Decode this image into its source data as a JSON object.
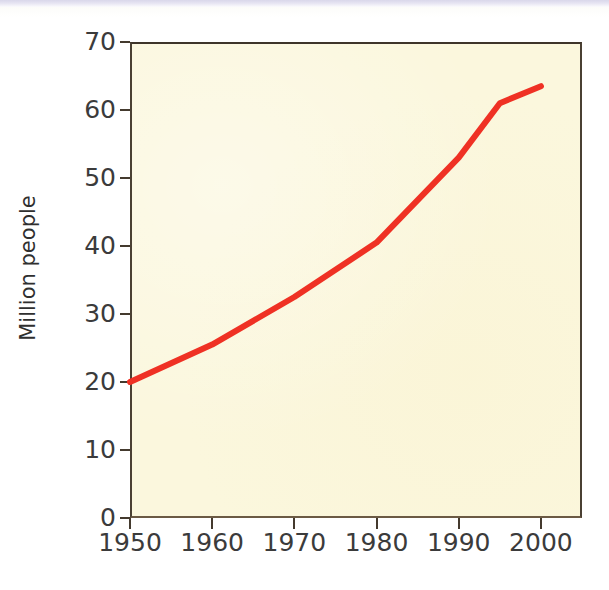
{
  "figure": {
    "background_color": "#ffffff",
    "plot_background_color": "#fbf7dd",
    "frame_color": "#4a4033",
    "series_color": "#ef3124"
  },
  "chart_data": {
    "type": "line",
    "title": "",
    "xlabel": "",
    "ylabel": "Million people",
    "xlim": [
      1950,
      2005
    ],
    "ylim": [
      0,
      70
    ],
    "grid": false,
    "legend": false,
    "x_ticks": [
      1950,
      1960,
      1970,
      1980,
      1990,
      2000
    ],
    "x_tick_labels": [
      "1950",
      "1960",
      "1970",
      "1980",
      "1990",
      "2000"
    ],
    "y_ticks": [
      0,
      10,
      20,
      30,
      40,
      50,
      60,
      70
    ],
    "y_tick_labels": [
      "0",
      "10",
      "20",
      "30",
      "40",
      "50",
      "60",
      "70"
    ],
    "series": [
      {
        "name": "Million people",
        "color": "#ef3124",
        "line_width": 6,
        "x": [
          1950,
          1960,
          1970,
          1980,
          1990,
          1995,
          2000
        ],
        "values": [
          20.0,
          25.5,
          32.5,
          40.5,
          53.0,
          61.0,
          63.5
        ]
      }
    ]
  }
}
